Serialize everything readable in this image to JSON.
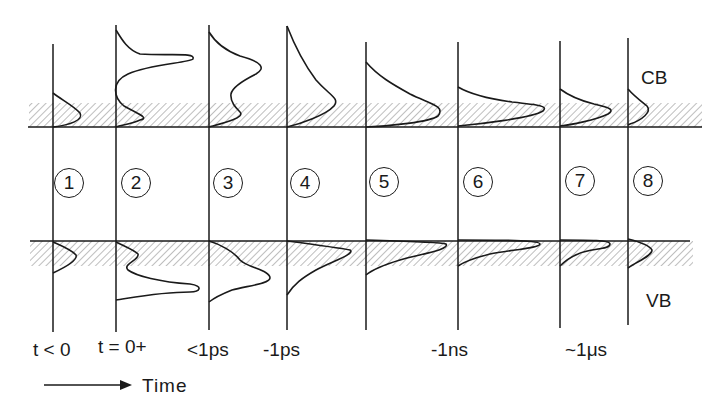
{
  "figure": {
    "band_labels": {
      "conduction": "CB",
      "valence": "VB"
    },
    "time_axis_label": "Time",
    "colors": {
      "ink": "#1a1a1a",
      "hatch": "#9a9a9a",
      "background": "#ffffff"
    }
  },
  "stages": [
    {
      "number": "1",
      "time_label": "t < 0"
    },
    {
      "number": "2",
      "time_label": "t = 0+"
    },
    {
      "number": "3",
      "time_label": "<1ps"
    },
    {
      "number": "4",
      "time_label": "-1ps"
    },
    {
      "number": "5",
      "time_label": ""
    },
    {
      "number": "6",
      "time_label": "-1ns"
    },
    {
      "number": "7",
      "time_label": "~1μs"
    },
    {
      "number": "8",
      "time_label": ""
    }
  ]
}
